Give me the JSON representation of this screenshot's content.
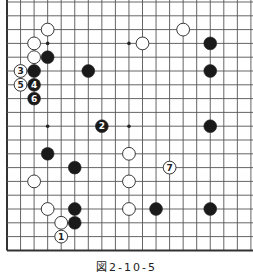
{
  "board": {
    "size": 19,
    "origin": {
      "x": 7,
      "y": 2
    },
    "spacing": {
      "x": 13.55,
      "y": 13.8
    },
    "line_color": "#555555",
    "edge_color": "#333333",
    "edges": {
      "left": true,
      "right": false,
      "top": false,
      "bottom": true
    },
    "hoshi": [
      [
        3,
        3
      ],
      [
        9,
        3
      ],
      [
        3,
        9
      ],
      [
        9,
        9
      ]
    ],
    "stones": [
      {
        "color": "white",
        "col": 3,
        "row": 2,
        "label": ""
      },
      {
        "color": "white",
        "col": 2,
        "row": 3,
        "label": ""
      },
      {
        "color": "white",
        "col": 2,
        "row": 4,
        "label": ""
      },
      {
        "color": "black",
        "col": 3,
        "row": 4,
        "label": ""
      },
      {
        "color": "white",
        "col": 1,
        "row": 5,
        "label": "3"
      },
      {
        "color": "black",
        "col": 2,
        "row": 5,
        "label": ""
      },
      {
        "color": "white",
        "col": 1,
        "row": 6,
        "label": "5"
      },
      {
        "color": "black",
        "col": 2,
        "row": 6,
        "label": "4"
      },
      {
        "color": "black",
        "col": 2,
        "row": 7,
        "label": "6"
      },
      {
        "color": "black",
        "col": 6,
        "row": 5,
        "label": ""
      },
      {
        "color": "black",
        "col": 7,
        "row": 9,
        "label": "2"
      },
      {
        "color": "white",
        "col": 10,
        "row": 3,
        "label": ""
      },
      {
        "color": "white",
        "col": 13,
        "row": 2,
        "label": ""
      },
      {
        "color": "black",
        "col": 15,
        "row": 3,
        "label": ""
      },
      {
        "color": "black",
        "col": 15,
        "row": 5,
        "label": ""
      },
      {
        "color": "black",
        "col": 15,
        "row": 9,
        "label": ""
      },
      {
        "color": "black",
        "col": 3,
        "row": 11,
        "label": ""
      },
      {
        "color": "black",
        "col": 5,
        "row": 12,
        "label": ""
      },
      {
        "color": "white",
        "col": 2,
        "row": 13,
        "label": ""
      },
      {
        "color": "white",
        "col": 3,
        "row": 15,
        "label": ""
      },
      {
        "color": "black",
        "col": 5,
        "row": 15,
        "label": ""
      },
      {
        "color": "white",
        "col": 4,
        "row": 16,
        "label": ""
      },
      {
        "color": "black",
        "col": 5,
        "row": 16,
        "label": ""
      },
      {
        "color": "white",
        "col": 4,
        "row": 17,
        "label": "1"
      },
      {
        "color": "white",
        "col": 9,
        "row": 11,
        "label": ""
      },
      {
        "color": "white",
        "col": 9,
        "row": 13,
        "label": ""
      },
      {
        "color": "white",
        "col": 9,
        "row": 15,
        "label": ""
      },
      {
        "color": "white",
        "col": 12,
        "row": 12,
        "label": "7"
      },
      {
        "color": "black",
        "col": 11,
        "row": 15,
        "label": ""
      },
      {
        "color": "black",
        "col": 15,
        "row": 15,
        "label": ""
      }
    ]
  },
  "caption": "図2-10-5"
}
